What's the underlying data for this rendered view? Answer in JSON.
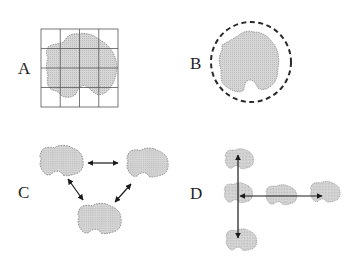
{
  "figure": {
    "panels": [
      {
        "id": "A",
        "label": "A",
        "description": "Irregular shape overlaid on a 4x4 grid"
      },
      {
        "id": "B",
        "label": "B",
        "description": "Irregular shape enclosed by a dashed circle"
      },
      {
        "id": "C",
        "label": "C",
        "description": "Three shapes connected pairwise by double-headed arrows"
      },
      {
        "id": "D",
        "label": "D",
        "description": "Shapes arranged along perpendicular axes with arrows"
      }
    ],
    "colors": {
      "shape_fill": "#d4d4d4",
      "shape_stroke": "#8a8a8a",
      "line": "#222222",
      "grid": "#555555"
    }
  }
}
